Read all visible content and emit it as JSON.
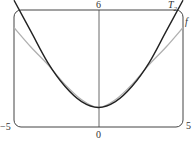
{
  "chart_data": {
    "type": "line",
    "title": "",
    "xlabel": "",
    "ylabel": "",
    "xlim": [
      -5,
      5
    ],
    "ylim": [
      0,
      6
    ],
    "grid": false,
    "tick_labels": {
      "x_min": "−5",
      "x_max": "5",
      "x_origin": "0",
      "y_max": "6"
    },
    "series": [
      {
        "name": "T₂",
        "label": "T",
        "subscript": "2",
        "color": "#222222",
        "x": [
          -5,
          -4,
          -3,
          -2,
          -1,
          0,
          1,
          2,
          3,
          4,
          5
        ],
        "y": [
          6.5,
          4.9,
          3.3,
          2.1,
          1.3,
          1.0,
          1.3,
          2.1,
          3.3,
          4.9,
          6.5
        ]
      },
      {
        "name": "f",
        "label": "f",
        "color": "#aaaaaa",
        "x": [
          -5,
          -4,
          -3,
          -2,
          -1,
          0,
          1,
          2,
          3,
          4,
          5
        ],
        "y": [
          5.1,
          4.1,
          3.2,
          2.2,
          1.4,
          1.0,
          1.4,
          2.2,
          3.2,
          4.1,
          5.1
        ]
      }
    ]
  }
}
